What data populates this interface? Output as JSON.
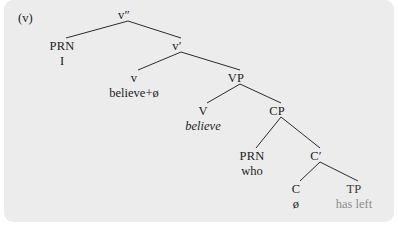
{
  "figure": {
    "example_label": "(v)",
    "kind": "syntactic-tree",
    "background_color": "#ececec",
    "text_color": "#1d1d1d",
    "faded_text_color": "#8d8d8d"
  },
  "nodes": {
    "root": {
      "category": "v″",
      "x": 124,
      "y": 14
    },
    "prn_subject": {
      "category": "PRN",
      "terminal": "I",
      "x": 62,
      "y": 45
    },
    "vbar": {
      "category": "v′",
      "x": 177,
      "y": 45
    },
    "little_v": {
      "category": "v",
      "terminal": "believe+ø",
      "x": 134,
      "y": 77
    },
    "vp": {
      "category": "VP",
      "x": 236,
      "y": 77
    },
    "big_v": {
      "category": "V",
      "terminal": "believe",
      "x": 203,
      "y": 110
    },
    "cp": {
      "category": "CP",
      "x": 277,
      "y": 110
    },
    "prn_who": {
      "category": "PRN",
      "terminal": "who",
      "x": 252,
      "y": 155
    },
    "cbar": {
      "category": "C′",
      "x": 316,
      "y": 155
    },
    "c_head": {
      "category": "C",
      "terminal": "ø",
      "x": 296,
      "y": 188
    },
    "tp": {
      "category": "TP",
      "terminal": "has left",
      "x": 354,
      "y": 188
    }
  },
  "edges": [
    {
      "from": "root",
      "to": "prn_subject"
    },
    {
      "from": "root",
      "to": "vbar"
    },
    {
      "from": "vbar",
      "to": "little_v"
    },
    {
      "from": "vbar",
      "to": "vp"
    },
    {
      "from": "vp",
      "to": "big_v"
    },
    {
      "from": "vp",
      "to": "cp"
    },
    {
      "from": "cp",
      "to": "prn_who"
    },
    {
      "from": "cp",
      "to": "cbar"
    },
    {
      "from": "cbar",
      "to": "c_head"
    },
    {
      "from": "cbar",
      "to": "tp"
    }
  ]
}
